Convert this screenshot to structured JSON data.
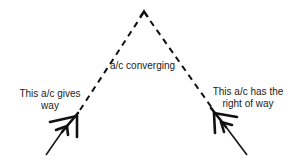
{
  "diagram": {
    "labels": {
      "converging": "a/c converging",
      "left_line1": "This a/c gives",
      "left_line2": "way",
      "right_line1": "This a/c has the",
      "right_line2": "right of way"
    },
    "colors": {
      "line": "#111111",
      "text": "#222222",
      "background": "#ffffff"
    }
  }
}
